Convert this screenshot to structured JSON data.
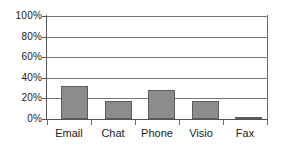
{
  "chart_data": {
    "type": "bar",
    "title": "",
    "subtitle": "",
    "xlabel": "",
    "ylabel": "",
    "categories": [
      "Email",
      "Chat",
      "Phone",
      "Visio",
      "Fax"
    ],
    "values": [
      32,
      17,
      28,
      17,
      2
    ],
    "value_labels": [
      "32%",
      "17%",
      "28%",
      "17%",
      "2%"
    ],
    "ylim": [
      0,
      100
    ],
    "ytick_values": [
      0,
      20,
      40,
      60,
      80,
      100
    ],
    "ytick_labels": [
      "0%",
      "20%",
      "40%",
      "60%",
      "80%",
      "100%"
    ],
    "grid": true,
    "grid_axis": "y",
    "legend": false,
    "legend_position": "none",
    "series": [
      {
        "name": "Share",
        "values": [
          32,
          17,
          28,
          17,
          2
        ],
        "color": "#8c8c8c"
      }
    ],
    "colors": {
      "bar_fill": "#8c8c8c",
      "bar_edge": "#5d5d5d",
      "gridline": "#777777",
      "axis": "#555555",
      "text": "#1a1a1a",
      "background": "#ffffff"
    }
  }
}
